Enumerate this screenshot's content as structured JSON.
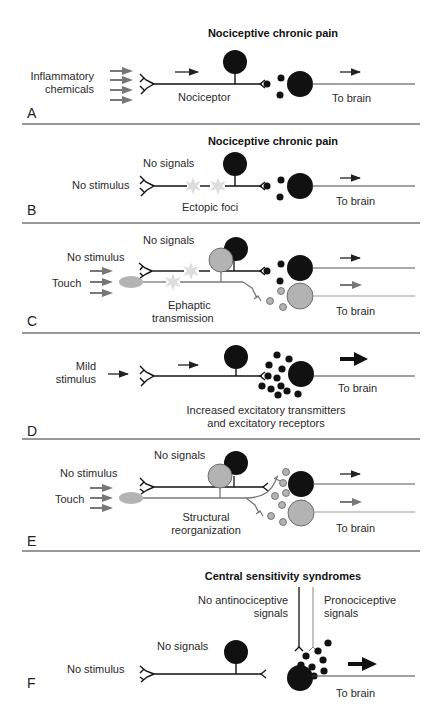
{
  "figure": {
    "panels": [
      {
        "letter": "A",
        "title": "Nociceptive chronic pain",
        "labels": {
          "stimulus_line1": "Inflammatory",
          "stimulus_line2": "chemicals",
          "neuron": "Nociceptor",
          "output": "To brain"
        }
      },
      {
        "letter": "B",
        "title": "Nociceptive chronic pain",
        "labels": {
          "stimulus": "No stimulus",
          "signals": "No signals",
          "foci": "Ectopic foci",
          "output": "To brain"
        }
      },
      {
        "letter": "C",
        "labels": {
          "stimulus": "No stimulus",
          "signals": "No signals",
          "touch": "Touch",
          "ephaptic_line1": "Ephaptic",
          "ephaptic_line2": "transmission",
          "output": "To brain"
        }
      },
      {
        "letter": "D",
        "labels": {
          "stimulus_line1": "Mild",
          "stimulus_line2": "stimulus",
          "output": "To brain",
          "note_line1": "Increased excitatory transmitters",
          "note_line2": "and excitatory receptors"
        }
      },
      {
        "letter": "E",
        "labels": {
          "stimulus": "No stimulus",
          "signals": "No signals",
          "touch": "Touch",
          "reorg_line1": "Structural",
          "reorg_line2": "reorganization",
          "output": "To brain"
        }
      },
      {
        "letter": "F",
        "title": "Central sensitivity syndromes",
        "labels": {
          "antino_line1": "No antinociceptive",
          "antino_line2": "signals",
          "prono_line1": "Pronociceptive",
          "prono_line2": "signals",
          "signals": "No signals",
          "stimulus": "No stimulus",
          "output": "To brain"
        }
      }
    ],
    "colors": {
      "black_neuron": "#111111",
      "gray_neuron": "#b3b3b3",
      "gray_arrow": "#7a7a7a",
      "ectopic_star": "#dcdcdc",
      "divider": "#333333"
    }
  }
}
